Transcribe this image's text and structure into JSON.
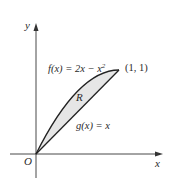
{
  "diagram": {
    "title": "",
    "axes": {
      "x_label": "x",
      "y_label": "y",
      "origin_label": "O"
    },
    "curves": [
      {
        "name": "f",
        "label": "f(x) = 2x − x",
        "exponent": "2",
        "equation": "f(x) = 2x - x^2"
      },
      {
        "name": "g",
        "label": "g(x) = x",
        "equation": "g(x) = x"
      }
    ],
    "region": {
      "label": "R",
      "fill": "#e6e6e6"
    },
    "point": {
      "label": "(1, 1)",
      "x": 1,
      "y": 1
    },
    "colors": {
      "stroke": "#222222",
      "axis": "#333333",
      "region_fill": "#e6e6e6"
    }
  }
}
